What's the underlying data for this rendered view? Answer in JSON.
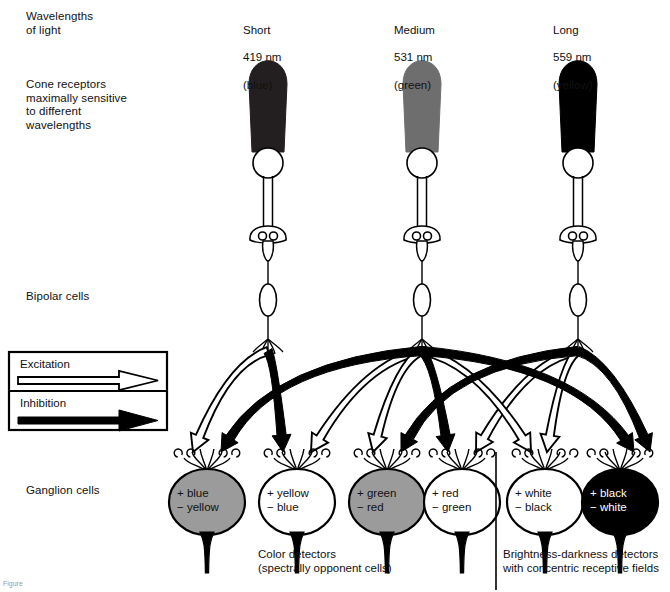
{
  "figure": {
    "figure_note": "Figure"
  },
  "row_labels": {
    "wavelengths": "Wavelengths\nof light",
    "cones": "Cone receptors\nmaximally sensitive\nto different\nwavelengths",
    "bipolar": "Bipolar cells",
    "ganglion": "Ganglion cells"
  },
  "cones": [
    {
      "name": "short-cone",
      "size": "Short",
      "wavelength": "419 nm",
      "color_word": "(blue)",
      "fill": "#231f20",
      "x": 268
    },
    {
      "name": "medium-cone",
      "size": "Medium",
      "wavelength": "531 nm",
      "color_word": "(green)",
      "fill": "#6e6e6e",
      "x": 422
    },
    {
      "name": "long-cone",
      "size": "Long",
      "wavelength": "559 nm",
      "color_word": "(yellow)",
      "fill": "#000000",
      "x": 578
    }
  ],
  "legend": {
    "excitation": "Excitation",
    "inhibition": "Inhibition",
    "excitation_arrow": "open-arrow-icon",
    "inhibition_arrow": "filled-arrow-icon"
  },
  "ganglion_cells": [
    {
      "name": "ganglion-blue-yellow",
      "plus": "+ blue",
      "minus": "− yellow",
      "fill": "#9b9b9b",
      "text_color": "dark",
      "x": 207
    },
    {
      "name": "ganglion-yellow-blue",
      "plus": "+ yellow",
      "minus": "− blue",
      "fill": "#ffffff",
      "text_color": "dark",
      "x": 297
    },
    {
      "name": "ganglion-green-red",
      "plus": "+ green",
      "minus": "− red",
      "fill": "#9b9b9b",
      "text_color": "dark",
      "x": 387
    },
    {
      "name": "ganglion-red-green",
      "plus": "+ red",
      "minus": "− green",
      "fill": "#ffffff",
      "text_color": "dark",
      "x": 462
    },
    {
      "name": "ganglion-white-black",
      "plus": "+ white",
      "minus": "− black",
      "fill": "#ffffff",
      "text_color": "dark",
      "x": 545
    },
    {
      "name": "ganglion-black-white",
      "plus": "+ black",
      "minus": "− white",
      "fill": "#000000",
      "text_color": "light",
      "x": 620
    }
  ],
  "captions": {
    "color_detectors": "Color detectors\n(spectrally opponent cells)",
    "brightness_detectors": "Brightness-darkness detectors\nwith concentric receptive fields"
  },
  "chart_data": {
    "type": "diagram",
    "cone_types": [
      {
        "label": "Short",
        "peak_nm": 419,
        "hue": "blue"
      },
      {
        "label": "Medium",
        "peak_nm": 531,
        "hue": "green"
      },
      {
        "label": "Long",
        "peak_nm": 559,
        "hue": "yellow"
      }
    ],
    "connections": [
      {
        "from": "short-cone",
        "to": "ganglion-blue-yellow",
        "type": "excitation"
      },
      {
        "from": "medium-cone",
        "to": "ganglion-blue-yellow",
        "type": "inhibition"
      },
      {
        "from": "short-cone",
        "to": "ganglion-yellow-blue",
        "type": "inhibition"
      },
      {
        "from": "medium-cone",
        "to": "ganglion-yellow-blue",
        "type": "excitation"
      },
      {
        "from": "medium-cone",
        "to": "ganglion-green-red",
        "type": "excitation"
      },
      {
        "from": "long-cone",
        "to": "ganglion-green-red",
        "type": "inhibition"
      },
      {
        "from": "medium-cone",
        "to": "ganglion-red-green",
        "type": "inhibition"
      },
      {
        "from": "long-cone",
        "to": "ganglion-red-green",
        "type": "excitation"
      },
      {
        "from": "medium-cone",
        "to": "ganglion-white-black",
        "type": "excitation"
      },
      {
        "from": "long-cone",
        "to": "ganglion-white-black",
        "type": "excitation"
      },
      {
        "from": "medium-cone",
        "to": "ganglion-black-white",
        "type": "inhibition"
      },
      {
        "from": "long-cone",
        "to": "ganglion-black-white",
        "type": "inhibition"
      }
    ],
    "groups": [
      {
        "name": "Color detectors (spectrally opponent cells)",
        "cells": [
          "ganglion-blue-yellow",
          "ganglion-yellow-blue",
          "ganglion-green-red",
          "ganglion-red-green"
        ]
      },
      {
        "name": "Brightness-darkness detectors with concentric receptive fields",
        "cells": [
          "ganglion-white-black",
          "ganglion-black-white"
        ]
      }
    ]
  }
}
